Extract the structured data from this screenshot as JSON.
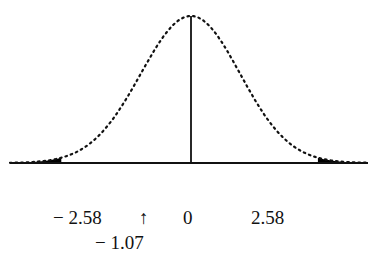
{
  "chart_data": {
    "type": "area",
    "title": "",
    "x_range": [
      -3.6,
      3.6
    ],
    "center_line_x": 0,
    "shaded_regions": [
      {
        "name": "left-tail",
        "from": -3.6,
        "to": -2.58
      },
      {
        "name": "right-tail",
        "from": 2.58,
        "to": 3.6
      }
    ],
    "tick_labels": [
      {
        "value": -2.58,
        "label": "− 2.58"
      },
      {
        "value": -1.07,
        "label": "↑",
        "annotation": "− 1.07"
      },
      {
        "value": 0,
        "label": "0"
      },
      {
        "value": 2.58,
        "label": "2.58"
      }
    ],
    "colors": {
      "curve": "#111111",
      "fill": "#000000",
      "background": "#ffffff"
    }
  },
  "labels": {
    "neg_crit": "− 2.58",
    "arrow": "↑",
    "zero": "0",
    "pos_crit": "2.58",
    "test_stat": "− 1.07"
  }
}
